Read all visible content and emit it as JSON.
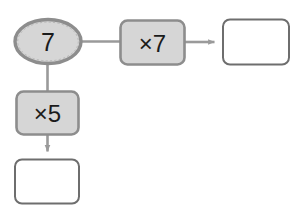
{
  "diagram": {
    "type": "function-machine-flow",
    "background_color": "#ffffff",
    "colors": {
      "node_fill": "#d6d6d6",
      "node_stroke": "#8d8d8d",
      "empty_fill": "#ffffff",
      "empty_stroke": "#6e6e6e",
      "connector": "#9a9a9a",
      "text": "#1b1b1b"
    },
    "nodes": {
      "start_oval": {
        "label": "7",
        "shape": "ellipse",
        "filled": true,
        "x": 14,
        "y": 19,
        "width": 68,
        "height": 45
      },
      "op_right": {
        "label": "×7",
        "shape": "rounded-rect",
        "filled": true,
        "x": 119,
        "y": 19,
        "width": 67,
        "height": 47
      },
      "result_right": {
        "label": "",
        "shape": "rounded-rect",
        "filled": false,
        "x": 222,
        "y": 18,
        "width": 68,
        "height": 48
      },
      "op_down": {
        "label": "×5",
        "shape": "rounded-rect",
        "filled": true,
        "x": 15,
        "y": 90,
        "width": 65,
        "height": 46
      },
      "result_down": {
        "label": "",
        "shape": "rounded-rect",
        "filled": false,
        "x": 14,
        "y": 158,
        "width": 66,
        "height": 47
      }
    },
    "connectors": [
      {
        "name": "oval-to-op-right",
        "from": "start_oval",
        "to": "op_right",
        "direction": "right",
        "arrowhead": false
      },
      {
        "name": "op-right-to-result",
        "from": "op_right",
        "to": "result_right",
        "direction": "right",
        "arrowhead": true
      },
      {
        "name": "oval-to-op-down",
        "from": "start_oval",
        "to": "op_down",
        "direction": "down",
        "arrowhead": false
      },
      {
        "name": "op-down-to-result",
        "from": "op_down",
        "to": "result_down",
        "direction": "down",
        "arrowhead": true
      }
    ]
  }
}
